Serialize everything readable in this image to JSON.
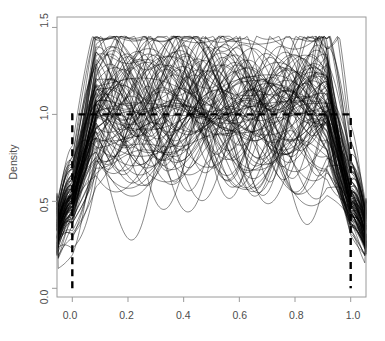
{
  "chart_data": {
    "type": "line",
    "title": "",
    "subtitle": "",
    "xlabel": "",
    "ylabel": "Density",
    "xlim": [
      -0.055,
      1.055
    ],
    "ylim": [
      -0.05,
      1.56
    ],
    "xticks": [
      0.0,
      0.2,
      0.4,
      0.6,
      0.8,
      1.0
    ],
    "xtick_labels": [
      "0.0",
      "0.2",
      "0.4",
      "0.6",
      "0.8",
      "1.0"
    ],
    "yticks": [
      0.0,
      0.5,
      1.0,
      1.5
    ],
    "ytick_labels": [
      "0.0",
      "0.5",
      "1.0",
      "1.5"
    ],
    "grid": false,
    "legend": "none",
    "box": true,
    "series_count": 100,
    "series_color": "#000000",
    "series_linewidth": 0.55,
    "reference_curve": {
      "name": "Uniform(0,1) true density",
      "style": "dashed",
      "color": "#000000",
      "linewidth": 2.4,
      "dasharray": "7,5",
      "x": [
        0.0,
        0.0,
        1.0,
        1.0
      ],
      "y": [
        0.0,
        1.0,
        1.0,
        0.0
      ]
    },
    "curve_stats": {
      "left_endpoint_range": [
        0.18,
        0.55
      ],
      "right_endpoint_range": [
        0.17,
        0.52
      ],
      "interior_range": [
        0.58,
        1.45
      ],
      "peak_max": 1.45,
      "mean_interior_level": 1.0
    },
    "series": [
      {
        "name": "density-1",
        "seed": 1
      },
      {
        "name": "density-2",
        "seed": 2
      },
      {
        "name": "density-3",
        "seed": 3
      }
    ]
  },
  "axes": {
    "y_axis_title": "Density",
    "x_tick_0": "0.0",
    "x_tick_1": "0.2",
    "x_tick_2": "0.4",
    "x_tick_3": "0.6",
    "x_tick_4": "0.8",
    "x_tick_5": "1.0",
    "y_tick_0": "0.0",
    "y_tick_1": "0.5",
    "y_tick_2": "1.0",
    "y_tick_3": "1.5"
  }
}
